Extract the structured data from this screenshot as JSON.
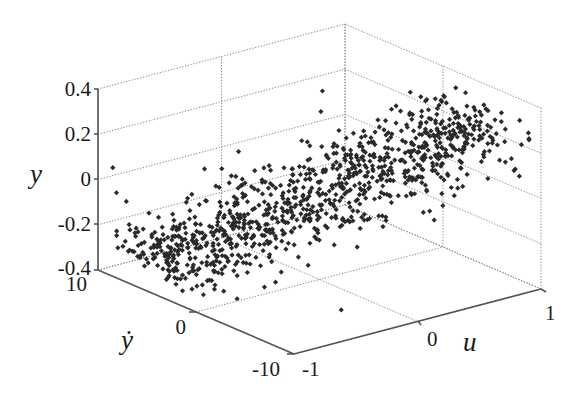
{
  "chart_data": {
    "type": "scatter3d",
    "title": "",
    "axes": {
      "x": {
        "label": "u",
        "range": [
          -1,
          1
        ],
        "ticks": [
          -1,
          0,
          1
        ],
        "tick_labels": [
          "-1",
          "0",
          "1"
        ]
      },
      "y": {
        "label": "ẏ",
        "range": [
          -10,
          10
        ],
        "ticks": [
          10,
          0,
          -10
        ],
        "tick_labels": [
          "10",
          "0",
          "-10"
        ]
      },
      "z": {
        "label": "y",
        "range": [
          -0.4,
          0.4
        ],
        "ticks": [
          0.4,
          0.2,
          0,
          -0.2,
          -0.4
        ],
        "tick_labels": [
          "0.4",
          "0.2",
          "0",
          "-0.2",
          "-0.4"
        ]
      }
    },
    "grid": true,
    "legend": null,
    "marker": {
      "shape": "diamond",
      "color": "#2a2a2a",
      "size": 3
    },
    "approx_point_count": 1000,
    "trend": "y increases roughly linearly with u (≈0.3·u), noise ±0.1; ẏ spread across about -8..8",
    "clusters": [
      {
        "name": "low-dense",
        "u_center": -0.6,
        "ydot_center": 5,
        "y_center": -0.25
      },
      {
        "name": "high-dense",
        "u_center": 0.65,
        "ydot_center": -3,
        "y_center": 0.2
      }
    ],
    "sample_points": [
      [
        -0.6,
        5,
        -0.25
      ],
      [
        -0.55,
        4,
        -0.27
      ],
      [
        -0.7,
        6,
        -0.22
      ],
      [
        -0.5,
        3,
        -0.2
      ],
      [
        -0.4,
        2,
        -0.15
      ],
      [
        -0.3,
        1,
        -0.1
      ],
      [
        -0.2,
        0,
        -0.05
      ],
      [
        0.0,
        0,
        0.0
      ],
      [
        0.1,
        -1,
        0.03
      ],
      [
        0.2,
        -1,
        0.06
      ],
      [
        0.4,
        -2,
        0.12
      ],
      [
        0.5,
        -3,
        0.15
      ],
      [
        0.65,
        -3,
        0.2
      ],
      [
        0.7,
        -4,
        0.22
      ],
      [
        0.8,
        -5,
        0.2
      ],
      [
        0.9,
        -6,
        0.15
      ],
      [
        -0.9,
        8,
        -0.2
      ],
      [
        -0.85,
        9,
        -0.1
      ],
      [
        0.95,
        -8,
        0.1
      ],
      [
        -0.1,
        7,
        0.05
      ]
    ],
    "outliers": [
      [
        -0.92,
        9.5,
        0.05
      ],
      [
        -0.93,
        9.0,
        -0.05
      ],
      [
        0.98,
        -7.5,
        0.08
      ],
      [
        0.5,
        6,
        0.25
      ],
      [
        -0.3,
        -6,
        -0.38
      ]
    ]
  },
  "labels": {
    "z_axis": "y",
    "y_axis": "ẏ",
    "x_axis": "u",
    "z_ticks": [
      "0.4",
      "0.2",
      "0",
      "-0.2",
      "-0.4"
    ],
    "ydot_ticks": [
      "10",
      "0",
      "-10"
    ],
    "u_ticks": [
      "-1",
      "0",
      "1"
    ]
  }
}
